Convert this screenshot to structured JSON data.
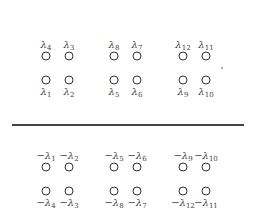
{
  "diagram": {
    "boundary": {
      "type": "hatched-ground-line",
      "y": 124,
      "x_start": 12,
      "x_end": 244
    },
    "upper_half": {
      "groups": [
        {
          "name": "group-1",
          "top_row": [
            {
              "base": "λ",
              "sub": "4",
              "x": 46
            },
            {
              "base": "λ",
              "sub": "3",
              "x": 69
            }
          ],
          "bottom_row": [
            {
              "base": "λ",
              "sub": "1",
              "x": 46
            },
            {
              "base": "λ",
              "sub": "2",
              "x": 69
            }
          ]
        },
        {
          "name": "group-2",
          "top_row": [
            {
              "base": "λ",
              "sub": "8",
              "x": 114
            },
            {
              "base": "λ",
              "sub": "7",
              "x": 137
            }
          ],
          "bottom_row": [
            {
              "base": "λ",
              "sub": "5",
              "x": 114
            },
            {
              "base": "λ",
              "sub": "6",
              "x": 137
            }
          ]
        },
        {
          "name": "group-3",
          "top_row": [
            {
              "base": "λ",
              "sub": "12",
              "x": 183
            },
            {
              "base": "λ",
              "sub": "11",
              "x": 206
            }
          ],
          "bottom_row": [
            {
              "base": "λ",
              "sub": "9",
              "x": 183
            },
            {
              "base": "λ",
              "sub": "10",
              "x": 206
            }
          ]
        }
      ],
      "top_label_y": 40,
      "top_circle_y": 56,
      "bottom_circle_y": 80,
      "bottom_label_y": 87
    },
    "lower_half": {
      "groups": [
        {
          "name": "group-1",
          "top_row": [
            {
              "base": "−λ",
              "sub": "1",
              "x": 46
            },
            {
              "base": "−λ",
              "sub": "2",
              "x": 69
            }
          ],
          "bottom_row": [
            {
              "base": "−λ",
              "sub": "4",
              "x": 46
            },
            {
              "base": "−λ",
              "sub": "3",
              "x": 69
            }
          ]
        },
        {
          "name": "group-2",
          "top_row": [
            {
              "base": "−λ",
              "sub": "5",
              "x": 114
            },
            {
              "base": "−λ",
              "sub": "6",
              "x": 137
            }
          ],
          "bottom_row": [
            {
              "base": "−λ",
              "sub": "8",
              "x": 114
            },
            {
              "base": "−λ",
              "sub": "7",
              "x": 137
            }
          ]
        },
        {
          "name": "group-3",
          "top_row": [
            {
              "base": "−λ",
              "sub": "9",
              "x": 183
            },
            {
              "base": "−λ",
              "sub": "10",
              "x": 206
            }
          ],
          "bottom_row": [
            {
              "base": "−λ",
              "sub": "12",
              "x": 183
            },
            {
              "base": "−λ",
              "sub": "11",
              "x": 206
            }
          ]
        }
      ],
      "top_label_y": 151,
      "top_circle_y": 167,
      "bottom_circle_y": 191,
      "bottom_label_y": 198
    },
    "colors": {
      "circle": "#333333",
      "label": "#444444",
      "line": "#444444",
      "background": "#ffffff"
    }
  }
}
